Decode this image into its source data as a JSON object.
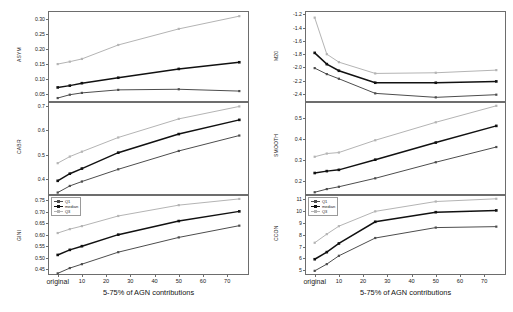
{
  "figure": {
    "xaxis_title": "5-75% of AGN contributions",
    "x_tick_labels": [
      "original",
      "10",
      "20",
      "30",
      "40",
      "50",
      "60",
      "70"
    ],
    "x_tick_values": [
      0,
      10,
      20,
      30,
      40,
      50,
      60,
      70
    ],
    "legend": {
      "entries": [
        {
          "label": "Q1",
          "color": "#4d4d4d"
        },
        {
          "label": "median",
          "color": "#111111"
        },
        {
          "label": "Q3",
          "color": "#b4b4b4"
        }
      ]
    },
    "colors": {
      "q1": "#4d4d4d",
      "median": "#111111",
      "q3": "#b4b4b4",
      "axis": "#6d6d6d",
      "text": "#1a1a1a"
    }
  },
  "chart_data": [
    {
      "type": "line",
      "title": "",
      "panel": "asym",
      "xlabel": "5-75% of AGN contributions",
      "ylabel": "ASYM",
      "x": [
        0,
        5,
        10,
        25,
        50,
        75
      ],
      "xlim": [
        -4,
        79
      ],
      "ylim": [
        0.025,
        0.325
      ],
      "yticks": [
        0.05,
        0.1,
        0.15,
        0.2,
        0.25,
        0.3
      ],
      "ytick_labels": [
        "0.05",
        "0.10",
        "0.15",
        "0.20",
        "0.25",
        "0.30"
      ],
      "grid": false,
      "legend_position": "none",
      "series": [
        {
          "name": "Q1",
          "values": [
            0.038,
            0.049,
            0.055,
            0.065,
            0.067,
            0.061
          ]
        },
        {
          "name": "median",
          "values": [
            0.073,
            0.079,
            0.087,
            0.105,
            0.134,
            0.156
          ]
        },
        {
          "name": "Q3",
          "values": [
            0.15,
            0.158,
            0.167,
            0.213,
            0.266,
            0.308
          ]
        }
      ]
    },
    {
      "type": "line",
      "title": "",
      "panel": "cabr",
      "xlabel": "5-75% of AGN contributions",
      "ylabel": "CABR",
      "x": [
        0,
        5,
        10,
        25,
        50,
        75
      ],
      "xlim": [
        -4,
        79
      ],
      "ylim": [
        0.335,
        0.715
      ],
      "yticks": [
        0.4,
        0.5,
        0.6,
        0.7
      ],
      "ytick_labels": [
        "0.4",
        "0.5",
        "0.6",
        "0.7"
      ],
      "grid": false,
      "legend_position": "none",
      "series": [
        {
          "name": "Q1",
          "values": [
            0.345,
            0.372,
            0.39,
            0.44,
            0.515,
            0.578
          ]
        },
        {
          "name": "median",
          "values": [
            0.393,
            0.422,
            0.443,
            0.508,
            0.584,
            0.642
          ]
        },
        {
          "name": "Q3",
          "values": [
            0.465,
            0.492,
            0.512,
            0.57,
            0.646,
            0.697
          ]
        }
      ]
    },
    {
      "type": "line",
      "title": "",
      "panel": "gini",
      "xlabel": "5-75% of AGN contributions",
      "ylabel": "GINI",
      "x": [
        0,
        5,
        10,
        25,
        50,
        75
      ],
      "xlim": [
        -4,
        79
      ],
      "ylim": [
        0.425,
        0.772
      ],
      "yticks": [
        0.45,
        0.5,
        0.55,
        0.6,
        0.65,
        0.7,
        0.75
      ],
      "ytick_labels": [
        "0.45",
        "0.50",
        "0.55",
        "0.60",
        "0.65",
        "0.70",
        "0.75"
      ],
      "grid": false,
      "legend_position": "upper left",
      "series": [
        {
          "name": "Q1",
          "values": [
            0.432,
            0.455,
            0.472,
            0.524,
            0.588,
            0.639
          ]
        },
        {
          "name": "median",
          "values": [
            0.512,
            0.534,
            0.55,
            0.6,
            0.659,
            0.701
          ]
        },
        {
          "name": "Q3",
          "values": [
            0.607,
            0.624,
            0.637,
            0.681,
            0.728,
            0.755
          ]
        }
      ]
    },
    {
      "type": "line",
      "title": "",
      "panel": "m20",
      "xlabel": "5-75% of AGN contributions",
      "ylabel": "M20",
      "x": [
        0,
        5,
        10,
        25,
        50,
        75
      ],
      "xlim": [
        -4,
        79
      ],
      "ylim": [
        -2.52,
        -1.15
      ],
      "yticks": [
        -1.2,
        -1.4,
        -1.6,
        -1.8,
        -2.0,
        -2.2,
        -2.4
      ],
      "ytick_labels": [
        "-1.2",
        "-1.4",
        "-1.6",
        "-1.8",
        "-2.0",
        "-2.2",
        "-2.4"
      ],
      "grid": false,
      "legend_position": "none",
      "series": [
        {
          "name": "Q1",
          "values": [
            -2.01,
            -2.1,
            -2.17,
            -2.39,
            -2.45,
            -2.41
          ]
        },
        {
          "name": "median",
          "values": [
            -1.78,
            -1.95,
            -2.05,
            -2.23,
            -2.23,
            -2.21
          ]
        },
        {
          "name": "Q3",
          "values": [
            -1.25,
            -1.8,
            -1.92,
            -2.09,
            -2.08,
            -2.04
          ]
        }
      ]
    },
    {
      "type": "line",
      "title": "",
      "panel": "smooth",
      "xlabel": "5-75% of AGN contributions",
      "ylabel": "SMOOTH",
      "x": [
        0,
        5,
        10,
        25,
        50,
        75
      ],
      "xlim": [
        -4,
        79
      ],
      "ylim": [
        0.135,
        0.575
      ],
      "yticks": [
        0.2,
        0.3,
        0.4,
        0.5
      ],
      "ytick_labels": [
        "0.2",
        "0.3",
        "0.4",
        "0.5"
      ],
      "grid": false,
      "legend_position": "none",
      "series": [
        {
          "name": "Q1",
          "values": [
            0.148,
            0.163,
            0.174,
            0.214,
            0.29,
            0.362
          ]
        },
        {
          "name": "median",
          "values": [
            0.239,
            0.248,
            0.254,
            0.302,
            0.383,
            0.462
          ]
        },
        {
          "name": "Q3",
          "values": [
            0.316,
            0.331,
            0.336,
            0.394,
            0.479,
            0.557
          ]
        }
      ]
    },
    {
      "type": "line",
      "title": "",
      "panel": "ccon",
      "xlabel": "5-75% of AGN contributions",
      "ylabel": "CCON",
      "x": [
        0,
        5,
        10,
        25,
        50,
        75
      ],
      "xlim": [
        -4,
        79
      ],
      "ylim": [
        4.6,
        11.35
      ],
      "yticks": [
        5,
        6,
        7,
        8,
        9,
        10,
        11
      ],
      "ytick_labels": [
        "5",
        "6",
        "7",
        "8",
        "9",
        "10",
        "11"
      ],
      "grid": false,
      "legend_position": "upper left",
      "series": [
        {
          "name": "Q1",
          "values": [
            4.95,
            5.52,
            6.22,
            7.72,
            8.6,
            8.68
          ]
        },
        {
          "name": "median",
          "values": [
            5.93,
            6.53,
            7.26,
            9.09,
            9.9,
            10.05
          ]
        },
        {
          "name": "Q3",
          "values": [
            7.32,
            8.05,
            8.72,
            9.97,
            10.8,
            11.03
          ]
        }
      ]
    }
  ]
}
